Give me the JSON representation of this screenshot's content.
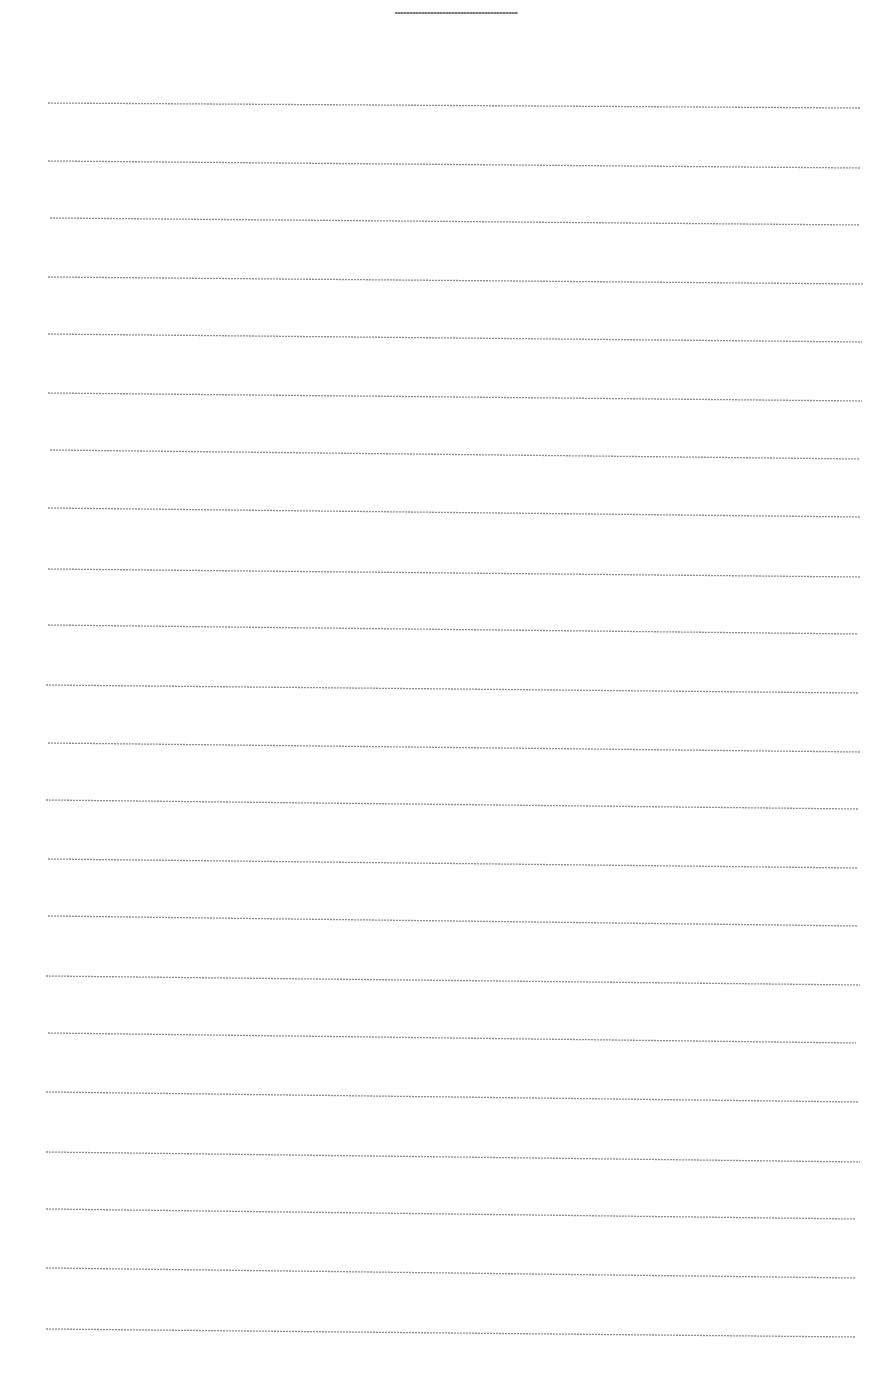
{
  "document": {
    "type": "blank lined writing sheet",
    "header_line": {
      "x1": 395,
      "x2": 518,
      "y": 13
    },
    "rule_color": "#8a8a8a",
    "ruled_lines": [
      {
        "x1": 48,
        "y1": 103,
        "x2": 860,
        "y2": 108
      },
      {
        "x1": 48,
        "y1": 161,
        "x2": 860,
        "y2": 168
      },
      {
        "x1": 50,
        "y1": 218,
        "x2": 860,
        "y2": 225
      },
      {
        "x1": 48,
        "y1": 277,
        "x2": 864,
        "y2": 284
      },
      {
        "x1": 48,
        "y1": 334,
        "x2": 862,
        "y2": 342
      },
      {
        "x1": 48,
        "y1": 393,
        "x2": 862,
        "y2": 401
      },
      {
        "x1": 50,
        "y1": 450,
        "x2": 860,
        "y2": 459
      },
      {
        "x1": 48,
        "y1": 508,
        "x2": 860,
        "y2": 517
      },
      {
        "x1": 48,
        "y1": 569,
        "x2": 860,
        "y2": 577
      },
      {
        "x1": 48,
        "y1": 625,
        "x2": 858,
        "y2": 634
      },
      {
        "x1": 46,
        "y1": 685,
        "x2": 858,
        "y2": 693
      },
      {
        "x1": 48,
        "y1": 743,
        "x2": 860,
        "y2": 752
      },
      {
        "x1": 46,
        "y1": 800,
        "x2": 858,
        "y2": 809
      },
      {
        "x1": 48,
        "y1": 859,
        "x2": 858,
        "y2": 868
      },
      {
        "x1": 48,
        "y1": 916,
        "x2": 858,
        "y2": 926
      },
      {
        "x1": 46,
        "y1": 976,
        "x2": 860,
        "y2": 985
      },
      {
        "x1": 48,
        "y1": 1033,
        "x2": 856,
        "y2": 1043
      },
      {
        "x1": 46,
        "y1": 1092,
        "x2": 858,
        "y2": 1102
      },
      {
        "x1": 46,
        "y1": 1152,
        "x2": 860,
        "y2": 1162
      },
      {
        "x1": 46,
        "y1": 1209,
        "x2": 856,
        "y2": 1219
      },
      {
        "x1": 46,
        "y1": 1268,
        "x2": 856,
        "y2": 1278
      },
      {
        "x1": 46,
        "y1": 1329,
        "x2": 855,
        "y2": 1337
      }
    ]
  }
}
